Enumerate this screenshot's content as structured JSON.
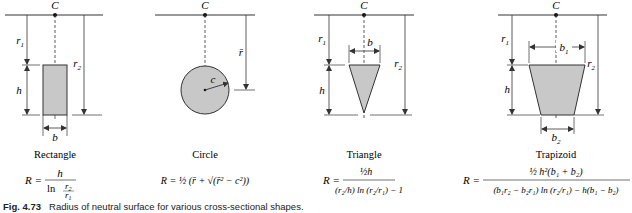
{
  "center_label": "C",
  "shapes": [
    {
      "name": "Rectangle",
      "labels": {
        "r1": "r",
        "r1_sub": "1",
        "r2": "r",
        "r2_sub": "2",
        "h": "h",
        "b": "b"
      },
      "formula": {
        "lhs": "R =",
        "num": "h",
        "den_ln": "ln",
        "den_frac_num": "r",
        "den_frac_num_sub": "2",
        "den_frac_den": "r",
        "den_frac_den_sub": "1"
      }
    },
    {
      "name": "Circle",
      "labels": {
        "r": "r̄",
        "c": "c"
      },
      "formula": {
        "text": "R = ½ (r̄ + √(r̄² − c²))"
      }
    },
    {
      "name": "Triangle",
      "labels": {
        "r1": "r",
        "r1_sub": "1",
        "r2": "r",
        "r2_sub": "2",
        "h": "h",
        "b": "b"
      },
      "formula": {
        "lhs": "R =",
        "num": "½h",
        "den": "(r₂/h) ln (r₂/r₁) − 1"
      }
    },
    {
      "name": "Trapizoid",
      "labels": {
        "r1": "r",
        "r1_sub": "1",
        "r2": "r",
        "r2_sub": "2",
        "h": "h",
        "b1": "b",
        "b1_sub": "1",
        "b2": "b",
        "b2_sub": "2"
      },
      "formula": {
        "lhs": "R =",
        "num": "½ h²(b₁ + b₂)",
        "den": "(b₁r₂ − b₂r₁) ln (r₂/r₁) − h(b₁ − b₂)"
      }
    }
  ],
  "caption": {
    "number": "Fig. 4.73",
    "text": "Radius of neutral surface for various cross-sectional shapes."
  },
  "colors": {
    "fill": "#c8c8c8",
    "line": "#333333"
  }
}
